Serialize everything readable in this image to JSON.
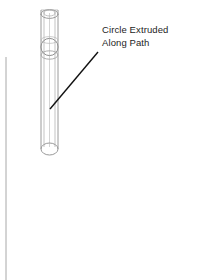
{
  "figure": {
    "title": "Circle Extruded Along Path",
    "type": "cad-line-drawing",
    "background_color": "#ffffff",
    "line_color": "#8c8c8c",
    "leader_color": "#000000",
    "text_color": "#1d1d1d"
  },
  "annotation": {
    "line1": "Circle Extruded",
    "line2": "Along Path"
  },
  "geometry": {
    "tube": {
      "left_x": 41,
      "right_x": 58,
      "top_y": 10,
      "bottom_y": 149,
      "cap_ry": 6
    },
    "profile_circle": {
      "cx": 49.5,
      "cy": 47,
      "r": 8.5
    },
    "path_line": {
      "x": 6,
      "y_top": 57,
      "y_bottom": 280
    },
    "leader": {
      "x1": 98,
      "y1": 52,
      "x2": 50,
      "y2": 109
    }
  }
}
